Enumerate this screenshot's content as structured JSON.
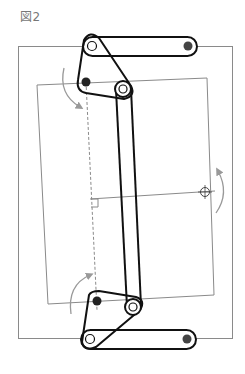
{
  "figure": {
    "label": "図2"
  },
  "colors": {
    "frame_line": "#8a8a8a",
    "link_line": "#111111",
    "filled_pin": "#444444",
    "open_pin": "#ffffff",
    "arrow": "#999999",
    "background": "#ffffff"
  },
  "elements": {
    "outer_frame": "rectangle",
    "inner_frame": "tilted rectangle",
    "top_link": "horizontal link bar with open and filled pivot",
    "bottom_link": "horizontal link bar with open and filled pivot",
    "upper_triangle_link": "triangular link",
    "lower_triangle_link": "triangular link",
    "coupler_bar": "long vertical bar",
    "rotation_arrows": 3,
    "pivot_marker": "crosshair circle",
    "right_angle_marker": "square"
  }
}
